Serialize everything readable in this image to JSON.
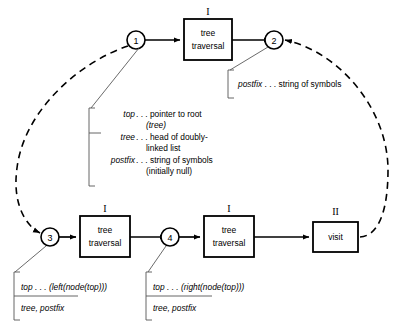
{
  "diagram": {
    "nodes": [
      {
        "id": "n1",
        "label": "1",
        "cx": 136,
        "cy": 40
      },
      {
        "id": "n2",
        "label": "2",
        "cx": 274,
        "cy": 40
      },
      {
        "id": "n3",
        "label": "3",
        "cx": 50,
        "cy": 237
      },
      {
        "id": "n4",
        "label": "4",
        "cx": 170,
        "cy": 237
      }
    ],
    "boxes": [
      {
        "id": "b1",
        "roman": "I",
        "line1": "tree",
        "line2": "traversal",
        "x": 184,
        "y": 19,
        "w": 48,
        "h": 41
      },
      {
        "id": "b2",
        "roman": "I",
        "line1": "tree",
        "line2": "traversal",
        "x": 80,
        "y": 216,
        "w": 50,
        "h": 41
      },
      {
        "id": "b3",
        "roman": "I",
        "line1": "tree",
        "line2": "traversal",
        "x": 204,
        "y": 216,
        "w": 50,
        "h": 41
      },
      {
        "id": "b4",
        "roman": "II",
        "line1": "visit",
        "line2": "",
        "x": 313,
        "y": 222,
        "w": 45,
        "h": 30
      }
    ],
    "annotations": {
      "postfix_top": {
        "id": "a-postfix-top",
        "lines": [
          {
            "italic": "postfix",
            "rest": " . . . string of symbols"
          }
        ]
      },
      "center_block": {
        "id": "a-center",
        "rows": [
          {
            "italic": "top",
            "rest": " . . . pointer to root"
          },
          {
            "italic": "",
            "rest": "(tree)",
            "cont": true,
            "italicCont": "tree"
          },
          {
            "italic": "tree",
            "rest": " . . . head of doubly-"
          },
          {
            "italic": "",
            "rest": "linked list",
            "cont": true
          },
          {
            "italic": "postfix",
            "rest": " . . . string of symbols"
          },
          {
            "italic": "",
            "rest": "(initially null)",
            "cont": true
          }
        ],
        "text_lines": [
          "top . . . pointer to root",
          "(tree)",
          "tree . . . head of doubly-",
          "linked list",
          "postfix . . . string of symbols",
          "(initially null)"
        ]
      },
      "left_bottom": {
        "id": "a-left-bottom",
        "line1_italic": "top",
        "line1_rest": " . . . (left(node(top)))",
        "line2": "tree, postfix"
      },
      "right_bottom": {
        "id": "a-right-bottom",
        "line1_italic": "top",
        "line1_rest": " . . . (right(node(top)))",
        "line2": "tree, postfix"
      }
    },
    "edges": [
      {
        "id": "e1",
        "from": "n1",
        "to": "b1",
        "style": "solid"
      },
      {
        "id": "e2",
        "from": "b1",
        "to": "n2",
        "style": "solid"
      },
      {
        "id": "e3",
        "from": "n1",
        "to": "n3",
        "style": "dashed"
      },
      {
        "id": "e4",
        "from": "b4",
        "to": "n2",
        "style": "dashed"
      },
      {
        "id": "e5",
        "from": "n3",
        "to": "b2",
        "style": "solid"
      },
      {
        "id": "e6",
        "from": "b2",
        "to": "n4",
        "style": "solid"
      },
      {
        "id": "e7",
        "from": "n4",
        "to": "b3",
        "style": "solid"
      },
      {
        "id": "e8",
        "from": "b3",
        "to": "b4",
        "style": "solid"
      }
    ]
  }
}
